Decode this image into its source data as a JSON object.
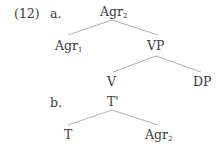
{
  "example_number": "(12)",
  "trees": [
    {
      "label": "a.",
      "root": {
        "text": "Agr",
        "sub": "2"
      },
      "children": [
        {
          "text": "Agr",
          "sub": "1"
        },
        {
          "text": "VP",
          "sub": ""
        }
      ],
      "vp_children": [
        {
          "text": "V",
          "sub": ""
        },
        {
          "text": "DP",
          "sub": ""
        }
      ]
    },
    {
      "label": "b.",
      "root": {
        "text": "T'",
        "sub": ""
      },
      "children": [
        {
          "text": "T",
          "sub": ""
        },
        {
          "text": "Agr",
          "sub": "2"
        }
      ]
    }
  ]
}
